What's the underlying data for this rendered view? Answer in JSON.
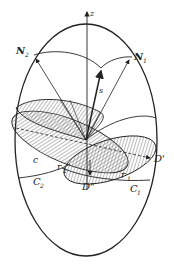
{
  "figure": {
    "type": "geometric-diagram",
    "colors": {
      "stroke": "#222222",
      "hatch": "#555555",
      "background": "#ffffff"
    }
  },
  "labels": {
    "z_axis": "z",
    "n1": "N",
    "n1_sub": "1",
    "n2": "N",
    "n2_sub": "2",
    "s": "s",
    "c": "c",
    "r1": "r",
    "r1_sub": "1",
    "r2": "r",
    "r2_sub": "2",
    "d_prime": "D'",
    "d_double_prime": "D\"",
    "c1": "C",
    "c1_sub": "1",
    "c2": "C",
    "c2_sub": "2"
  }
}
